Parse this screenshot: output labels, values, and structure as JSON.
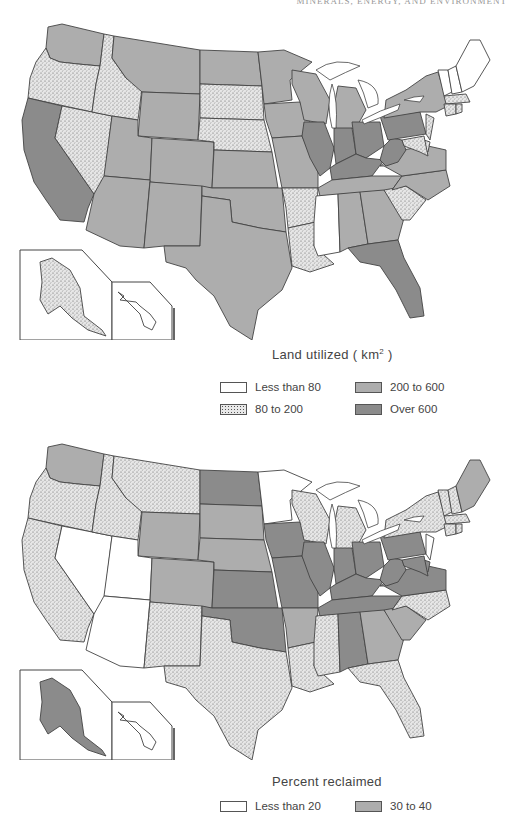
{
  "header": {
    "running_head": "MINERALS, ENERGY, AND ENVIRONMENT"
  },
  "colors": {
    "class_white": "#ffffff",
    "class_stipple": "#e6e6e6",
    "class_mid": "#adadad",
    "class_dark": "#8b8b8b",
    "border": "#444444"
  },
  "map1": {
    "title": "Land utilized",
    "unit_open": "( km",
    "unit_sup": "2",
    "unit_close": " )",
    "legend": [
      {
        "label": "Less than 80",
        "style": "white"
      },
      {
        "label": "80 to 200",
        "style": "stipple"
      },
      {
        "label": "200 to 600",
        "style": "mid"
      },
      {
        "label": "Over 600",
        "style": "dark"
      }
    ],
    "states": {
      "white": [
        "ME",
        "NH",
        "VT",
        "MS"
      ],
      "stipple": [
        "OR",
        "ID",
        "NV",
        "SD",
        "NE",
        "AR",
        "LA",
        "SC",
        "MA",
        "CT",
        "RI",
        "NJ",
        "DE",
        "MD",
        "AK"
      ],
      "mid": [
        "WA",
        "MT",
        "WY",
        "UT",
        "CO",
        "AZ",
        "NM",
        "TX",
        "ND",
        "KS",
        "OK",
        "MN",
        "IA",
        "MO",
        "WI",
        "MI",
        "NY",
        "TN",
        "AL",
        "GA",
        "NC",
        "VA"
      ],
      "dark": [
        "CA",
        "IL",
        "IN",
        "OH",
        "KY",
        "WV",
        "PA",
        "FL"
      ]
    }
  },
  "map2": {
    "title": "Percent reclaimed",
    "legend": [
      {
        "label": "Less than 20",
        "style": "white"
      },
      {
        "label": "30 to 40",
        "style": "mid"
      }
    ],
    "states": {
      "white": [
        "NV",
        "UT",
        "AZ",
        "MN",
        "NJ"
      ],
      "stipple": [
        "OR",
        "CA",
        "ID",
        "MT",
        "NM",
        "TX",
        "LA",
        "MS",
        "FL",
        "NC",
        "WI",
        "MI",
        "NY",
        "VT",
        "NH",
        "MA",
        "CT",
        "RI"
      ],
      "mid": [
        "WA",
        "WY",
        "CO",
        "SD",
        "NE",
        "AR",
        "GA",
        "SC",
        "ME"
      ],
      "dark": [
        "ND",
        "KS",
        "OK",
        "IA",
        "MO",
        "IL",
        "IN",
        "OH",
        "KY",
        "WV",
        "PA",
        "TN",
        "AL",
        "VA",
        "MD",
        "DE",
        "AK"
      ]
    }
  }
}
